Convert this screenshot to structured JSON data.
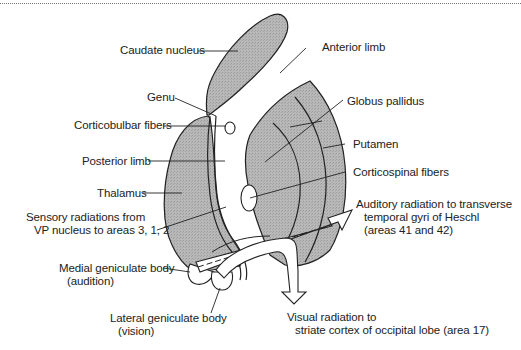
{
  "figure": {
    "fill_color": "#b3b3b3",
    "line_color": "#222222",
    "background": "#ffffff"
  },
  "labels": {
    "caudate_nucleus": "Caudate nucleus",
    "anterior_limb": "Anterior limb",
    "genu": "Genu",
    "globus_pallidus": "Globus pallidus",
    "corticobulbar_fibers": "Corticobulbar fibers",
    "putamen": "Putamen",
    "posterior_limb": "Posterior limb",
    "corticospinal_fibers": "Corticospinal fibers",
    "thalamus": "Thalamus",
    "sensory_radiations_line1": "Sensory radiations from",
    "sensory_radiations_line2": "VP nucleus to areas 3, 1, 2",
    "auditory_radiation_line1": "Auditory radiation to transverse",
    "auditory_radiation_line2": "temporal gyri of Heschl",
    "auditory_radiation_line3": "(areas 41 and 42)",
    "medial_geniculate_line1": "Medial geniculate body",
    "medial_geniculate_line2": "(audition)",
    "lateral_geniculate_line1": "Lateral geniculate body",
    "lateral_geniculate_line2": "(vision)",
    "visual_radiation_line1": "Visual radiation to",
    "visual_radiation_line2": "striate cortex of occipital lobe (area 17)"
  }
}
